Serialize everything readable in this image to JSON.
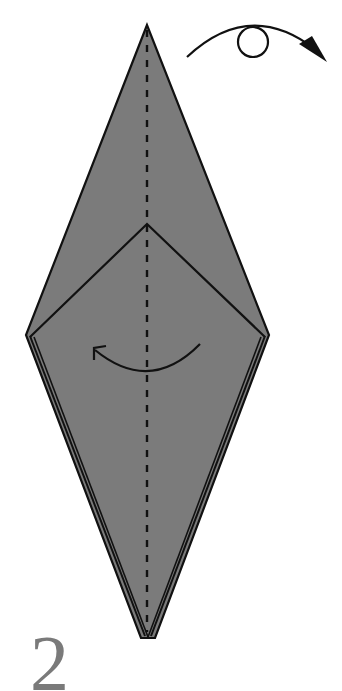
{
  "diagram": {
    "type": "origami-instruction-step",
    "step_number": "2",
    "colors": {
      "paper_fill": "#7b7b7b",
      "outline": "#111111",
      "step_number": "#7a7a7a",
      "background": "#ffffff"
    },
    "shape": {
      "top_tip": [
        147,
        25
      ],
      "left_corner": [
        26,
        335
      ],
      "right_corner": [
        269,
        335
      ],
      "bottom_tips": [
        [
          143,
          638
        ],
        [
          148,
          638
        ],
        [
          153,
          638
        ]
      ],
      "inner_v_apex": [
        147,
        224
      ]
    },
    "symbols": {
      "turn_over": {
        "icon": "turn-over-arrow-icon",
        "meaning": "Turn the model over",
        "loop_center": [
          253,
          43
        ],
        "loop_radius": 15
      },
      "valley_fold_line": {
        "icon": "valley-fold-dashed-line",
        "meaning": "Valley fold along center line"
      },
      "fold_arrow": {
        "icon": "fold-left-arrow-icon",
        "meaning": "Fold right half over to the left"
      }
    }
  }
}
